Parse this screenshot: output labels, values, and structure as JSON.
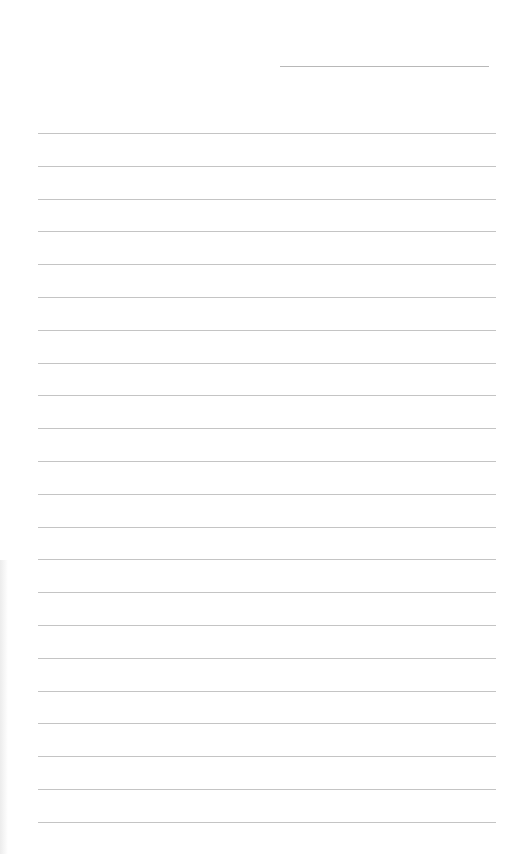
{
  "page": {
    "type": "lined-paper",
    "background": "#ffffff",
    "line_color": "#c4c4c4",
    "date_line": {
      "present": true,
      "text": ""
    },
    "ruled_lines": {
      "count": 22,
      "first_y": 133,
      "spacing": 32.8,
      "text": []
    }
  }
}
